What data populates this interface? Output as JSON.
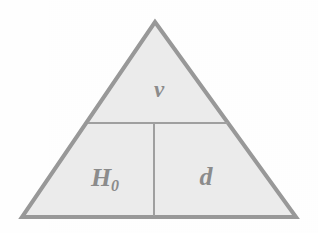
{
  "figure": {
    "name": "formula-triangle",
    "shape": "triangle",
    "background_color": "#ffffff",
    "fill_color": "#ececec",
    "stroke_color": "#999999",
    "divider_color": "#a0a0a0",
    "text_color": "#8c8c8c",
    "stroke_width": 4,
    "divider_width": 2,
    "geometry": {
      "apex": [
        155,
        22
      ],
      "bottom_left": [
        22,
        217
      ],
      "bottom_right": [
        296,
        217
      ],
      "horizontal_divider": [
        [
          88,
          123
        ],
        [
          228,
          123
        ]
      ],
      "vertical_divider": [
        [
          154,
          123
        ],
        [
          154,
          217
        ]
      ]
    },
    "cells": [
      {
        "id": "top",
        "label": "v",
        "label_subscript": "",
        "position": "top",
        "center": [
          155,
          90
        ]
      },
      {
        "id": "bottom-left",
        "label": "H",
        "label_subscript": "0",
        "position": "bottom-left",
        "center": [
          105,
          178
        ]
      },
      {
        "id": "bottom-right",
        "label": "d",
        "label_subscript": "",
        "position": "bottom-right",
        "center": [
          205,
          178
        ]
      }
    ]
  }
}
